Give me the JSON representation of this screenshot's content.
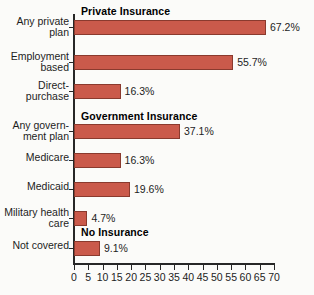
{
  "chart_data": {
    "type": "bar",
    "orientation": "horizontal",
    "title": "",
    "xlabel": "",
    "ylabel": "",
    "xlim": [
      0,
      70
    ],
    "xticks": [
      0,
      5,
      10,
      15,
      20,
      25,
      30,
      35,
      40,
      45,
      50,
      55,
      60,
      65,
      70
    ],
    "grid": false,
    "legend": "none",
    "value_suffix": "%",
    "bar_color": "#ca5a4b",
    "bar_border_color": "#8a3a2e",
    "axis_color": "#272727",
    "sections": [
      {
        "label": "Private Insurance",
        "first_row": 0
      },
      {
        "label": "Government Insurance",
        "first_row": 3
      },
      {
        "label": "No Insurance",
        "first_row": 7
      }
    ],
    "categories": [
      "Any private\nplan",
      "Employment\nbased",
      "Direct-\npurchase",
      "Any govern-\nment plan",
      "Medicare",
      "Medicaid",
      "Military health\ncare",
      "Not covered"
    ],
    "values": [
      67.2,
      55.7,
      16.3,
      37.1,
      16.3,
      19.6,
      4.7,
      9.1
    ],
    "value_labels": [
      "67.2%",
      "55.7%",
      "16.3%",
      "37.1%",
      "16.3%",
      "19.6%",
      "4.7%",
      "9.1%"
    ],
    "xtick_labels": [
      "0",
      "5",
      "10",
      "15",
      "20",
      "25",
      "30",
      "35",
      "40",
      "45",
      "50",
      "55",
      "60",
      "65",
      "70"
    ]
  }
}
